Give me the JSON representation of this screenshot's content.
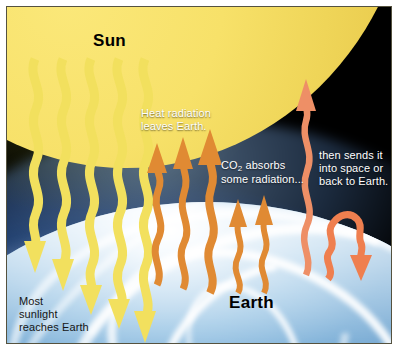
{
  "figure": {
    "kind": "greenhouse-effect-diagram",
    "titles": {
      "sun": "Sun",
      "earth": "Earth"
    },
    "labels": {
      "heat_radiation": "Heat radiation leaves Earth.",
      "heat_radiation_line1": "Heat radiation",
      "heat_radiation_line2": "leaves Earth.",
      "co2_absorbs_line1_prefix": "CO",
      "co2_absorbs_line1_sub": "2",
      "co2_absorbs_line1_suffix": " absorbs",
      "co2_absorbs_line2": "some radiation...",
      "then_sends_line1": "then sends it",
      "then_sends_line2": "into space or",
      "then_sends_line3": "back to Earth.",
      "most_sunlight_line1": "Most",
      "most_sunlight_line2": "sunlight",
      "most_sunlight_line3": "reaches Earth"
    },
    "colors": {
      "sun_yellow": "#f7e169",
      "sunlight_arrow": "#f2e05e",
      "heat_arrow": "#e08a33",
      "reradiated_arrow": "#ee8f66",
      "space_black": "#000000",
      "sky_blue": "#27508f",
      "earth_white": "#ffffff",
      "label_text": "#ffffff",
      "title_text": "#000000",
      "frame_rule": "#55523f",
      "paper": "#ffffff"
    },
    "arrow_groups": [
      {
        "name": "incoming-sunlight",
        "direction": "down",
        "color": "#f2e05e",
        "count": 5,
        "meaning": "Most sunlight reaches Earth"
      },
      {
        "name": "outgoing-heat-radiation",
        "direction": "up",
        "color": "#e08a33",
        "count": 5,
        "meaning": "Heat radiation leaves Earth"
      },
      {
        "name": "escaping-to-space",
        "direction": "up",
        "color": "#ee8f66",
        "count": 1,
        "meaning": "then sends it into space"
      },
      {
        "name": "reradiated-back-to-earth",
        "direction": "up-then-down",
        "color": "#ee8f66",
        "count": 1,
        "meaning": "or back to Earth"
      }
    ]
  }
}
